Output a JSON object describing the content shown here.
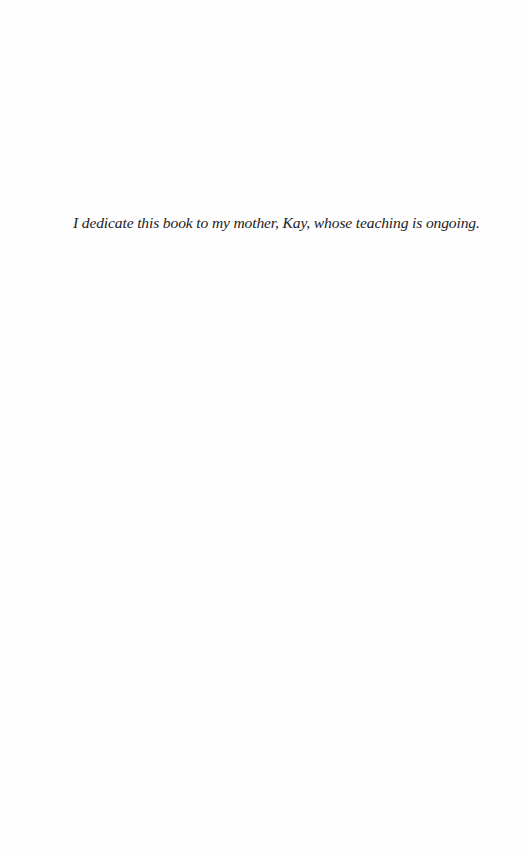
{
  "page": {
    "type": "dedication",
    "background_color": "#fefefe",
    "text_color": "#222222"
  },
  "dedication": {
    "text": "I dedicate this book to my mother, Kay, whose teaching is ongoing."
  }
}
